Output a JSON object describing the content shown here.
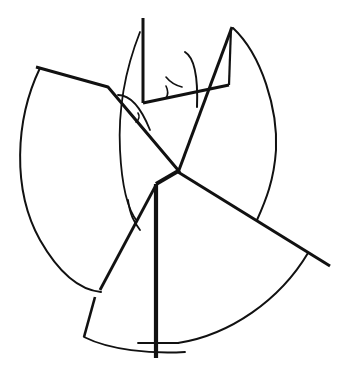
{
  "figure": {
    "width": 350,
    "height": 378,
    "background": "#ffffff",
    "stroke_color": "#111111",
    "thick_lines": [
      {
        "name": "top-left-vertical",
        "d": "M143,18 L143,103",
        "w": 3
      },
      {
        "name": "base-line",
        "d": "M143,103 L229,85",
        "w": 3.2
      },
      {
        "name": "right-short-vertical",
        "d": "M229,85 L231,28",
        "w": 2.2
      },
      {
        "name": "long-right-diagonal",
        "d": "M232,27 L179,170",
        "w": 3
      },
      {
        "name": "left-polyline",
        "d": "M36,67 L108,87 L178,170",
        "w": 3
      },
      {
        "name": "right-long-line",
        "d": "M178,172 L330,266",
        "w": 3
      },
      {
        "name": "center-joint",
        "d": "M180,170 L156,184",
        "w": 4
      },
      {
        "name": "main-vertical",
        "d": "M156,184 L156,358",
        "w": 4.2
      },
      {
        "name": "lower-left-diagonal",
        "d": "M156,185 L100,290",
        "w": 2.8
      },
      {
        "name": "lower-left-segment",
        "d": "M95,297 L84,337",
        "w": 2.6
      }
    ],
    "thin_lines": [
      {
        "name": "upper-left-arc-tangent",
        "d": "M140,32 C 125,70 118,110 120,150 C 122,190 128,210 137,221",
        "w": 1.8
      },
      {
        "name": "large-left-arc",
        "d": "M40,68 C 15,120 12,190 40,240 C 60,275 80,290 101,292",
        "w": 2
      },
      {
        "name": "large-right-arc",
        "d": "M233,28 C 262,55 278,110 276,150 C 274,180 266,200 257,220",
        "w": 2
      },
      {
        "name": "lower-right-arc",
        "d": "M308,253 C 280,300 230,335 178,343",
        "w": 2
      },
      {
        "name": "bottom-arc",
        "d": "M84,337 C 110,350 150,354 185,352",
        "w": 1.8
      },
      {
        "name": "bottom-tick",
        "d": "M138,343 L178,343",
        "w": 1.8
      },
      {
        "name": "small-angle-arc-left",
        "d": "M118,95 C 132,95 142,110 150,130",
        "w": 1.8
      },
      {
        "name": "small-angle-arc-left-inner",
        "d": "M138,113 C 140,116 139,120 136,122",
        "w": 1.6
      },
      {
        "name": "small-top-arc",
        "d": "M185,52 C 195,58 198,80 197,107",
        "w": 2
      },
      {
        "name": "small-tick-arc",
        "d": "M166,77 C 170,82 174,85 182,87",
        "w": 1.6
      },
      {
        "name": "small-tick-arc-2",
        "d": "M166,86 C 168,90 168,95 166,98",
        "w": 1.6
      },
      {
        "name": "vertical-left-arc-lower",
        "d": "M128,200 C 130,215 134,222 140,230",
        "w": 1.8
      }
    ]
  }
}
